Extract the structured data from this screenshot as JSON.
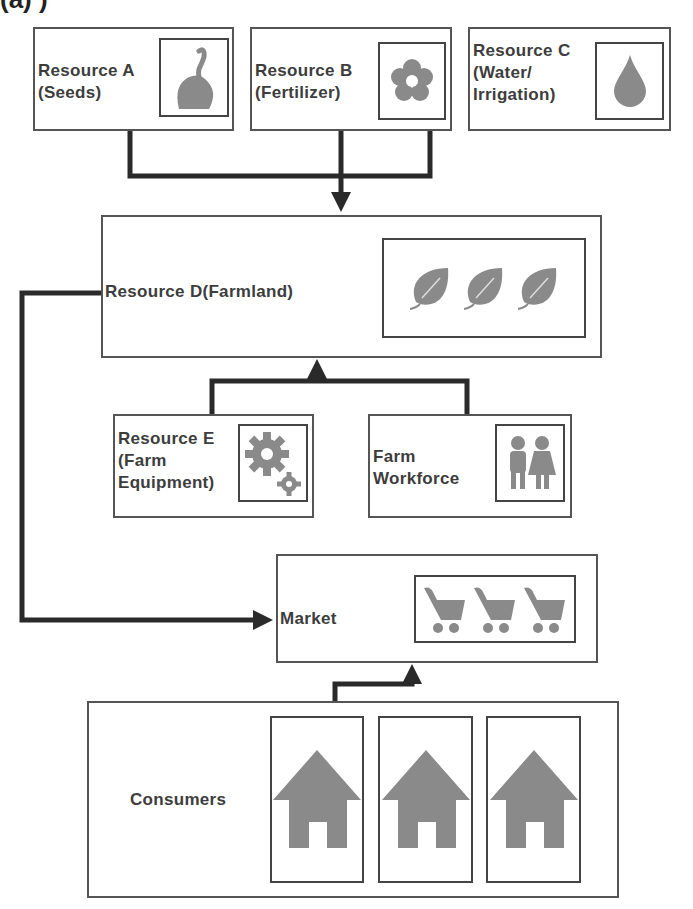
{
  "title_partial": "(a)                   )",
  "nodes": {
    "resource_a": {
      "label_1": "Resource A",
      "label_2": "(Seeds)",
      "icon": "seed-sprout-icon"
    },
    "resource_b": {
      "label_1": "Resource B",
      "label_2": "(Fertilizer)",
      "icon": "flower-icon"
    },
    "resource_c": {
      "label_1": "Resource C",
      "label_2": "(Water/",
      "label_3": "Irrigation)",
      "icon": "water-drop-icon"
    },
    "resource_d": {
      "label": "Resource D(Farmland)",
      "icon": "leaf-icon",
      "icon_count": 3
    },
    "resource_e": {
      "label_1": "Resource E",
      "label_2": "(Farm",
      "label_3": "Equipment)",
      "icon": "gears-icon"
    },
    "workforce": {
      "label_1": "Farm",
      "label_2": "Workforce",
      "icon": "people-icon"
    },
    "market": {
      "label": "Market",
      "icon": "shopping-cart-icon",
      "icon_count": 3
    },
    "consumers": {
      "label": "Consumers",
      "icon": "house-icon",
      "icon_count": 3
    }
  },
  "edges": [
    {
      "from": "resource_a",
      "to": "resource_d"
    },
    {
      "from": "resource_b",
      "to": "resource_d"
    },
    {
      "from": "resource_c",
      "to": "resource_d"
    },
    {
      "from": "resource_e",
      "to": "resource_d"
    },
    {
      "from": "workforce",
      "to": "resource_d"
    },
    {
      "from": "resource_d",
      "to": "market"
    },
    {
      "from": "consumers",
      "to": "market"
    }
  ],
  "colors": {
    "line": "#2a2a2a",
    "border": "#555555",
    "icon_fill": "#8a8a8a"
  }
}
